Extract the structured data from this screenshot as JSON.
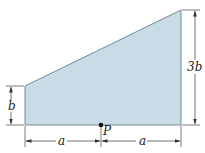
{
  "figure": {
    "shape_fill": "#c8dbe6",
    "shape_stroke": "#5a6f7c",
    "line_color": "#333333",
    "labels": {
      "left_height": "b",
      "right_height": "3b",
      "left_width": "a",
      "right_width": "a",
      "point": "P"
    }
  }
}
